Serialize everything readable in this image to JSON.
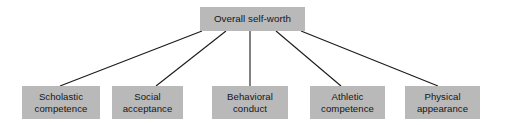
{
  "diagram": {
    "type": "hierarchy-tree",
    "title_text": "Overall self-worth",
    "canvas": {
      "width": 508,
      "height": 125,
      "background_color": "#ffffff"
    },
    "style": {
      "box_fill_color": "#b9b9b9",
      "text_color": "#15151a",
      "line_color": "#1a1a1a",
      "line_width": 1.1
    },
    "root": {
      "id": "overall-self-worth",
      "label": "Overall self-worth",
      "x": 200,
      "y": 7,
      "width": 105,
      "height": 24
    },
    "leaves": [
      {
        "id": "scholastic-competence",
        "label": "Scholastic\ncompetence",
        "line1": "Scholastic",
        "line2": "competence",
        "x": 22,
        "y": 86,
        "width": 78,
        "height": 33,
        "edge_from_x": 202,
        "edge_to_x": 60
      },
      {
        "id": "social-acceptance",
        "label": "Social\nacceptance",
        "line1": "Social",
        "line2": "acceptance",
        "x": 112,
        "y": 86,
        "width": 71,
        "height": 33,
        "edge_from_x": 226,
        "edge_to_x": 156
      },
      {
        "id": "behavioral-conduct",
        "label": "Behavioral\nconduct",
        "line1": "Behavioral",
        "line2": "conduct",
        "x": 212,
        "y": 86,
        "width": 76,
        "height": 33,
        "edge_from_x": 250,
        "edge_to_x": 250
      },
      {
        "id": "athletic-competence",
        "label": "Athletic\ncompetence",
        "line1": "Athletic",
        "line2": "competence",
        "x": 310,
        "y": 86,
        "width": 75,
        "height": 33,
        "edge_from_x": 276,
        "edge_to_x": 341
      },
      {
        "id": "physical-appearance",
        "label": "Physical\nappearance",
        "line1": "Physical",
        "line2": "appearance",
        "x": 405,
        "y": 86,
        "width": 75,
        "height": 33,
        "edge_from_x": 301,
        "edge_to_x": 438
      }
    ],
    "edges": [
      {
        "id": "edge-to-scholastic-competence",
        "x1": 202,
        "y1": 31,
        "x2": 60,
        "y2": 86
      },
      {
        "id": "edge-to-social-acceptance",
        "x1": 226,
        "y1": 31,
        "x2": 156,
        "y2": 86
      },
      {
        "id": "edge-to-behavioral-conduct",
        "x1": 250,
        "y1": 31,
        "x2": 250,
        "y2": 86
      },
      {
        "id": "edge-to-athletic-competence",
        "x1": 276,
        "y1": 31,
        "x2": 341,
        "y2": 86
      },
      {
        "id": "edge-to-physical-appearance",
        "x1": 301,
        "y1": 31,
        "x2": 438,
        "y2": 86
      }
    ]
  }
}
